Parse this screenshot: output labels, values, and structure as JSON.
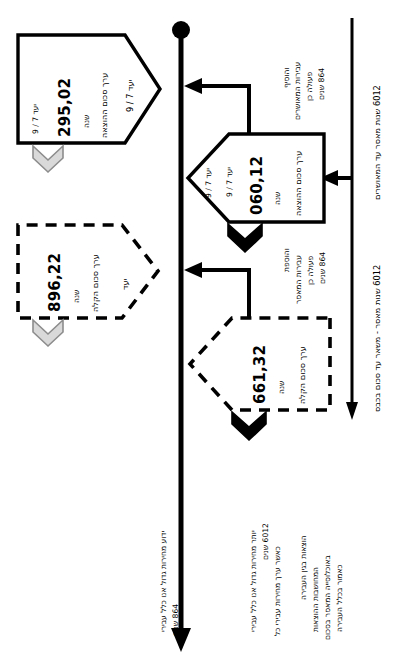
{
  "document": {
    "type": "timeline-flow-diagram",
    "language": "he",
    "orientation": "rotated-90-ccw",
    "background_color": "#ffffff",
    "line_color": "#000000",
    "gray_arrow_color": "#cccccc"
  },
  "timeline": {
    "name": "main-timeline-axis",
    "start_marker": "filled-circle",
    "end_marker": "arrowhead"
  },
  "right_axis_labels": [
    {
      "id": "label-top-right",
      "text": "2106 שנות מאסר עד המאושרים"
    },
    {
      "id": "label-bottom-right",
      "text": "2106 שנות מאסר - משאר עד סכום בכבס"
    }
  ],
  "nodes": [
    {
      "id": "node-1",
      "style": "solid",
      "value": "20,592",
      "unit": "שנה",
      "caption": "ערך סכום ההוצאה",
      "target": "יעד 7 / 9",
      "chevron_color": "gray",
      "chevron_name": "gray-chevron-down"
    },
    {
      "id": "node-2",
      "style": "solid",
      "value": "21,060",
      "unit": "שנה",
      "caption": "ערך סכום ההוצאה",
      "target": "יעד 7 / 9",
      "chevron_color": "black",
      "chevron_name": "black-chevron-down"
    },
    {
      "id": "node-3",
      "style": "dashed",
      "value": "22,698",
      "unit": "שנה",
      "caption": "ערך סכום הקלה",
      "target": "יעד",
      "chevron_color": "gray",
      "chevron_name": "gray-chevron-down"
    },
    {
      "id": "node-4",
      "style": "dashed",
      "value": "23,166",
      "unit": "שנה",
      "caption": "ערך סכום הקלה",
      "target": "",
      "chevron_color": "black",
      "chevron_name": "black-chevron-down"
    }
  ],
  "connector_annotations": [
    {
      "id": "annotation-upper",
      "lines": [
        "והוסיף",
        "עבירות המאושרים",
        "פעולה כן",
        "468 שנים"
      ]
    },
    {
      "id": "annotation-lower",
      "lines": [
        "והוספת",
        "עבירות המאסר",
        "פעולה כן",
        "468 שנים"
      ]
    }
  ],
  "footer_notes": [
    {
      "id": "footer-note-1",
      "lines": [
        "ידוע מחירות גדול אנו כלל עבירי",
        "468 שנים"
      ]
    },
    {
      "id": "footer-note-2",
      "lines": [
        "יותר מחירות גדול אנו כלל עבירי",
        "2106 שנים",
        "כאשר ערך מחירות עבירי כל"
      ]
    },
    {
      "id": "footer-note-3",
      "lines": [
        "הוצאות בגין העבירה",
        "המחושבות ההוצאות",
        "באוכלוסייה המאסר בסכום",
        "כאמור בכלל העבירה"
      ]
    }
  ]
}
